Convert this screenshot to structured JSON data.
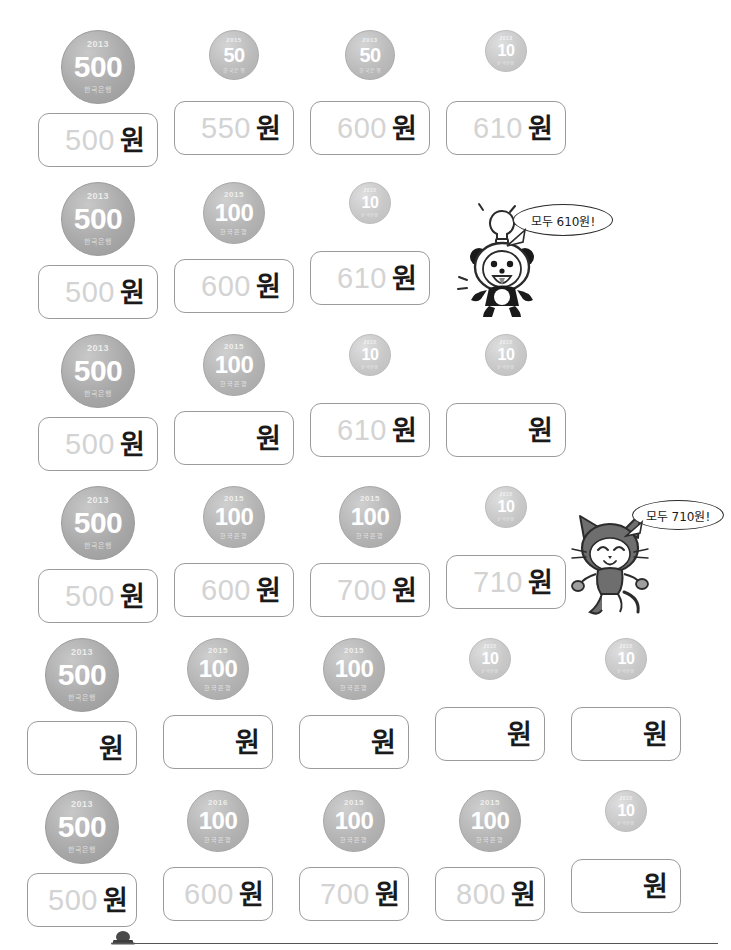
{
  "worksheet": {
    "currency_unit": "원",
    "coin_bank_label": "한국은행",
    "rows": [
      {
        "id": "row-1",
        "cells": [
          {
            "coin": {
              "denom": "500",
              "year": "2013",
              "size": "500"
            },
            "answer": "500",
            "blank": false
          },
          {
            "coin": {
              "denom": "50",
              "year": "2015",
              "size": "50"
            },
            "answer": "550",
            "blank": false
          },
          {
            "coin": {
              "denom": "50",
              "year": "2013",
              "size": "50"
            },
            "answer": "600",
            "blank": false
          },
          {
            "coin": {
              "denom": "10",
              "year": "2013",
              "size": "10"
            },
            "answer": "610",
            "blank": false
          }
        ]
      },
      {
        "id": "row-2",
        "cells": [
          {
            "coin": {
              "denom": "500",
              "year": "2013",
              "size": "500"
            },
            "answer": "500",
            "blank": false
          },
          {
            "coin": {
              "denom": "100",
              "year": "2015",
              "size": "100"
            },
            "answer": "600",
            "blank": false
          },
          {
            "coin": {
              "denom": "10",
              "year": "2015",
              "size": "10"
            },
            "answer": "610",
            "blank": false
          }
        ],
        "character": {
          "name": "panda-character",
          "speech": "모두 610원!"
        }
      },
      {
        "id": "row-3",
        "cells": [
          {
            "coin": {
              "denom": "500",
              "year": "2013",
              "size": "500"
            },
            "answer": "500",
            "blank": false
          },
          {
            "coin": {
              "denom": "100",
              "year": "2015",
              "size": "100"
            },
            "answer": "",
            "blank": true
          },
          {
            "coin": {
              "denom": "10",
              "year": "2015",
              "size": "10"
            },
            "answer": "610",
            "blank": false
          },
          {
            "coin": {
              "denom": "10",
              "year": "2015",
              "size": "10"
            },
            "answer": "",
            "blank": true
          }
        ]
      },
      {
        "id": "row-4",
        "cells": [
          {
            "coin": {
              "denom": "500",
              "year": "2013",
              "size": "500"
            },
            "answer": "500",
            "blank": false
          },
          {
            "coin": {
              "denom": "100",
              "year": "2015",
              "size": "100"
            },
            "answer": "600",
            "blank": false
          },
          {
            "coin": {
              "denom": "100",
              "year": "2015",
              "size": "100"
            },
            "answer": "700",
            "blank": false
          },
          {
            "coin": {
              "denom": "10",
              "year": "2015",
              "size": "10"
            },
            "answer": "710",
            "blank": false
          }
        ],
        "character": {
          "name": "cat-character",
          "speech": "모두 710원!"
        }
      },
      {
        "id": "row-5",
        "cells": [
          {
            "coin": {
              "denom": "500",
              "year": "2013",
              "size": "500"
            },
            "answer": "",
            "blank": true
          },
          {
            "coin": {
              "denom": "100",
              "year": "2015",
              "size": "100"
            },
            "answer": "",
            "blank": true
          },
          {
            "coin": {
              "denom": "100",
              "year": "2015",
              "size": "100"
            },
            "answer": "",
            "blank": true
          },
          {
            "coin": {
              "denom": "10",
              "year": "2015",
              "size": "10"
            },
            "answer": "",
            "blank": true
          },
          {
            "coin": {
              "denom": "10",
              "year": "2015",
              "size": "10"
            },
            "answer": "",
            "blank": true
          }
        ]
      },
      {
        "id": "row-6",
        "cells": [
          {
            "coin": {
              "denom": "500",
              "year": "2013",
              "size": "500"
            },
            "answer": "500",
            "blank": false
          },
          {
            "coin": {
              "denom": "100",
              "year": "2016",
              "size": "100"
            },
            "answer": "600",
            "blank": false
          },
          {
            "coin": {
              "denom": "100",
              "year": "2015",
              "size": "100"
            },
            "answer": "700",
            "blank": false
          },
          {
            "coin": {
              "denom": "100",
              "year": "2015",
              "size": "100"
            },
            "answer": "800",
            "blank": false
          },
          {
            "coin": {
              "denom": "10",
              "year": "2015",
              "size": "10"
            },
            "answer": "",
            "blank": true
          }
        ]
      }
    ]
  },
  "colors": {
    "answer_text": "#d3d3d3",
    "unit_text": "#1a1a1a",
    "box_border": "#9b9b9b",
    "coin_500": "#a9a9a9",
    "coin_100": "#b4b4b4",
    "coin_50": "#bcbcbc",
    "coin_10": "#c9c9c9",
    "ink": "#2b2b2b"
  }
}
